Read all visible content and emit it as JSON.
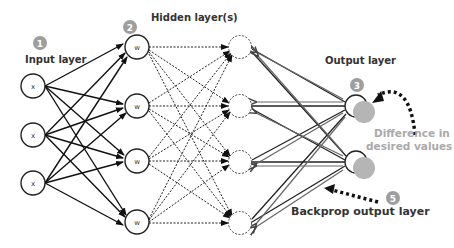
{
  "diagram": {
    "labels": {
      "input_layer": "Input layer",
      "hidden_layers": "Hidden layer(s)",
      "output_layer": "Output layer",
      "difference_line1": "Difference in",
      "difference_line2": "desired values",
      "backprop": "Backprop output layer"
    },
    "badges": [
      "1",
      "2",
      "3",
      "5"
    ],
    "input_nodes": [
      "x",
      "x",
      "x"
    ],
    "hidden1_nodes": [
      "w",
      "w",
      "w",
      "w"
    ],
    "hidden2_nodes": [
      "",
      "",
      "",
      ""
    ],
    "output_nodes": [
      "",
      ""
    ],
    "colors": {
      "badge": "#9e9e9e",
      "output_fill": "#b5b5b5",
      "line": "#222222",
      "backprop_line": "#555555",
      "gray_text": "#aaaaaa"
    }
  }
}
